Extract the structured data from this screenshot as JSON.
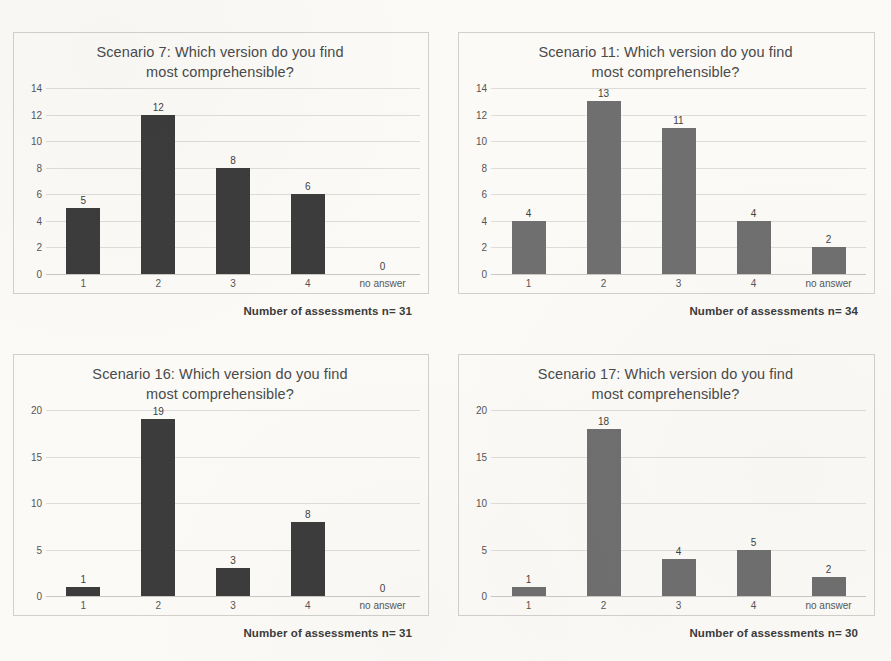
{
  "figure": {
    "layout": "2x2 grid of bar charts",
    "background_color": "#fbfaf7"
  },
  "chart_data": [
    {
      "type": "bar",
      "id": "scenario-7",
      "title": "Scenario 7: Which version do you find most comprehensible?",
      "title_line_1": "Scenario 7: Which version do you find",
      "title_line_2": "most comprehensible?",
      "categories": [
        "1",
        "2",
        "3",
        "4",
        "no answer"
      ],
      "values": [
        5,
        12,
        8,
        6,
        0
      ],
      "data_labels": [
        "5",
        "12",
        "8",
        "6",
        "0"
      ],
      "yticks": [
        14,
        12,
        10,
        8,
        6,
        4,
        2,
        0
      ],
      "ylim": [
        0,
        14
      ],
      "xlabel": "",
      "ylabel": "",
      "grid": true,
      "legend": "none",
      "bar_color": "#3c3c3c",
      "caption": "Number of assessments n= 31",
      "n": 31
    },
    {
      "type": "bar",
      "id": "scenario-11",
      "title": "Scenario 11: Which version do you find most comprehensible?",
      "title_line_1": "Scenario 11: Which version do you find",
      "title_line_2": "most comprehensible?",
      "categories": [
        "1",
        "2",
        "3",
        "4",
        "no answer"
      ],
      "values": [
        4,
        13,
        11,
        4,
        2
      ],
      "data_labels": [
        "4",
        "13",
        "11",
        "4",
        "2"
      ],
      "yticks": [
        14,
        12,
        10,
        8,
        6,
        4,
        2,
        0
      ],
      "ylim": [
        0,
        14
      ],
      "xlabel": "",
      "ylabel": "",
      "grid": true,
      "legend": "none",
      "bar_color": "#6f6f6f",
      "caption": "Number of assessments n= 34",
      "n": 34
    },
    {
      "type": "bar",
      "id": "scenario-16",
      "title": "Scenario 16: Which version do you find most comprehensible?",
      "title_line_1": "Scenario 16: Which version do you find",
      "title_line_2": "most comprehensible?",
      "categories": [
        "1",
        "2",
        "3",
        "4",
        "no answer"
      ],
      "values": [
        1,
        19,
        3,
        8,
        0
      ],
      "data_labels": [
        "1",
        "19",
        "3",
        "8",
        "0"
      ],
      "yticks": [
        20,
        15,
        10,
        5,
        0
      ],
      "ylim": [
        0,
        20
      ],
      "xlabel": "",
      "ylabel": "",
      "grid": true,
      "legend": "none",
      "bar_color": "#3c3c3c",
      "caption": "Number of assessments n= 31",
      "n": 31
    },
    {
      "type": "bar",
      "id": "scenario-17",
      "title": "Scenario 17: Which version do you find most comprehensible?",
      "title_line_1": "Scenario 17: Which version do you find",
      "title_line_2": "most comprehensible?",
      "categories": [
        "1",
        "2",
        "3",
        "4",
        "no answer"
      ],
      "values": [
        1,
        18,
        4,
        5,
        2
      ],
      "data_labels": [
        "1",
        "18",
        "4",
        "5",
        "2"
      ],
      "yticks": [
        20,
        15,
        10,
        5,
        0
      ],
      "ylim": [
        0,
        20
      ],
      "xlabel": "",
      "ylabel": "",
      "grid": true,
      "legend": "none",
      "bar_color": "#6f6f6f",
      "caption": "Number of assessments n= 30",
      "n": 30
    }
  ]
}
